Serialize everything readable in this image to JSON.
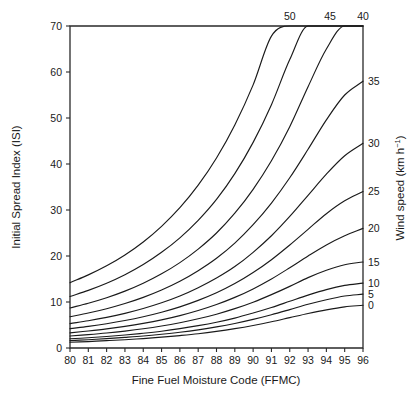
{
  "chart_data": {
    "type": "line",
    "title": "",
    "xlabel": "Fine Fuel Moisture Code (FFMC)",
    "ylabel": "Initial Spread Index (ISI)",
    "y2label": "Wind speed (km h−1)",
    "xlim": [
      80,
      96
    ],
    "ylim": [
      0,
      70
    ],
    "xticks": [
      80,
      81,
      82,
      83,
      84,
      85,
      86,
      87,
      88,
      89,
      90,
      91,
      92,
      93,
      94,
      95,
      96
    ],
    "xticklabels": [
      "80",
      "81",
      "82",
      "83",
      "84",
      "85",
      "86",
      "87",
      "88",
      "89",
      "90",
      "91",
      "92",
      "93",
      "94",
      "95",
      "96"
    ],
    "yticks": [
      0,
      10,
      20,
      30,
      40,
      50,
      60,
      70
    ],
    "yticklabels": [
      "0",
      "10",
      "20",
      "30",
      "40",
      "50",
      "60",
      "70"
    ],
    "grid": false,
    "legend_position": "curve-end-labels",
    "x": [
      80,
      81,
      82,
      83,
      84,
      85,
      86,
      87,
      88,
      89,
      90,
      91,
      92,
      93,
      94,
      95,
      96
    ],
    "series": [
      {
        "name": "0",
        "label": "0",
        "label_side": "right",
        "label_value_isi": 9.3,
        "values": [
          1.25,
          1.4,
          1.6,
          1.8,
          2.05,
          2.35,
          2.7,
          3.1,
          3.6,
          4.2,
          4.9,
          5.7,
          6.6,
          7.5,
          8.3,
          8.95,
          9.3
        ]
      },
      {
        "name": "5",
        "label": "5",
        "label_side": "right",
        "label_value_isi": 11.7,
        "values": [
          1.6,
          1.8,
          2.03,
          2.3,
          2.6,
          2.98,
          3.42,
          3.95,
          4.58,
          5.33,
          6.22,
          7.23,
          8.35,
          9.5,
          10.5,
          11.3,
          11.7
        ]
      },
      {
        "name": "10",
        "label": "10",
        "label_side": "right",
        "label_value_isi": 14.1,
        "values": [
          2.0,
          2.23,
          2.5,
          2.82,
          3.2,
          3.65,
          4.2,
          4.85,
          5.6,
          6.5,
          7.6,
          8.8,
          10.15,
          11.5,
          12.7,
          13.6,
          14.1
        ]
      },
      {
        "name": "15",
        "label": "15",
        "label_side": "right",
        "label_value_isi": 18.7,
        "values": [
          2.6,
          2.9,
          3.25,
          3.68,
          4.18,
          4.78,
          5.5,
          6.35,
          7.35,
          8.55,
          9.95,
          11.6,
          13.4,
          15.3,
          16.9,
          18.1,
          18.7
        ]
      },
      {
        "name": "20",
        "label": "20",
        "label_side": "right",
        "label_value_isi": 26.0,
        "values": [
          3.3,
          3.7,
          4.15,
          4.7,
          5.35,
          6.12,
          7.05,
          8.15,
          9.45,
          11.0,
          12.85,
          15.0,
          17.45,
          20.0,
          22.4,
          24.4,
          26.0
        ]
      },
      {
        "name": "25",
        "label": "25",
        "label_side": "right",
        "label_value_isi": 34.0,
        "values": [
          4.2,
          4.7,
          5.28,
          5.97,
          6.8,
          7.78,
          8.95,
          10.35,
          12.0,
          14.0,
          16.4,
          19.2,
          22.4,
          25.8,
          29.2,
          32.0,
          34.0
        ]
      },
      {
        "name": "30",
        "label": "30",
        "label_side": "right",
        "label_value_isi": 44.5,
        "values": [
          5.3,
          5.93,
          6.66,
          7.53,
          8.58,
          9.82,
          11.3,
          13.1,
          15.2,
          17.7,
          20.8,
          24.4,
          28.6,
          33.2,
          37.8,
          41.8,
          44.5
        ]
      },
      {
        "name": "35",
        "label": "35",
        "label_side": "right",
        "label_value_isi": 58.0,
        "values": [
          6.8,
          7.6,
          8.54,
          9.66,
          11.0,
          12.6,
          14.5,
          16.8,
          19.5,
          22.8,
          26.8,
          31.5,
          37.0,
          43.2,
          49.6,
          55.0,
          58.0
        ]
      },
      {
        "name": "40",
        "label": "40",
        "label_side": "top",
        "label_exit_ffmc": 96.0,
        "values": [
          8.7,
          9.73,
          10.93,
          12.36,
          14.07,
          16.12,
          18.56,
          21.5,
          25.0,
          29.3,
          34.5,
          40.7,
          48.1,
          56.8,
          65.0,
          70.0,
          70.0
        ]
      },
      {
        "name": "45",
        "label": "45",
        "label_side": "top",
        "label_exit_ffmc": 94.2,
        "values": [
          11.2,
          12.53,
          14.08,
          15.93,
          18.14,
          20.8,
          23.95,
          27.75,
          32.3,
          37.9,
          44.7,
          52.9,
          62.7,
          70.0,
          70.0,
          70.0,
          70.0
        ]
      },
      {
        "name": "50",
        "label": "50",
        "label_side": "top",
        "label_exit_ffmc": 92.0,
        "values": [
          14.2,
          15.9,
          17.87,
          20.23,
          23.05,
          26.45,
          30.5,
          35.4,
          41.3,
          48.5,
          57.2,
          67.8,
          70.0,
          70.0,
          70.0,
          70.0,
          70.0
        ]
      }
    ]
  },
  "labels": {
    "x_title": "Fine Fuel Moisture Code (FFMC)",
    "y_title": "Initial Spread Index (ISI)",
    "y2_title_main": "Wind speed (km h",
    "y2_title_sup": "−1",
    "y2_title_close": ")"
  },
  "colors": {
    "line": "#1a1a1a",
    "axis": "#2a2a2a",
    "background": "#ffffff"
  }
}
